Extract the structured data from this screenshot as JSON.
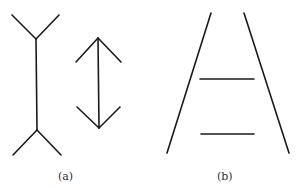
{
  "figure": {
    "panels": [
      {
        "label": "(a)",
        "description": "Müller-Lyer illusion: two vertical shafts of equal length, one with outward fins, one with inward arrowheads"
      },
      {
        "label": "(b)",
        "description": "Ponzo illusion: two equal horizontal lines between converging rails"
      }
    ],
    "stroke_color": "#1a1a1a",
    "background": "#ffffff"
  }
}
